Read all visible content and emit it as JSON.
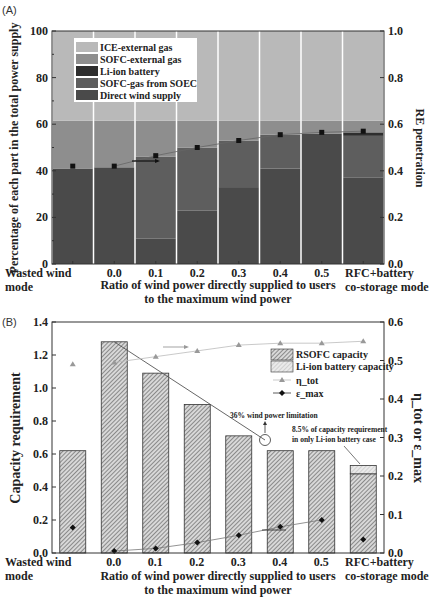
{
  "chart_data": [
    {
      "panel": "(A)",
      "type": "bar",
      "stacked": true,
      "categories": [
        "Wasted wind mode",
        "0.0",
        "0.1",
        "0.2",
        "0.3",
        "0.4",
        "0.5",
        "RFC+battery co-storage mode"
      ],
      "category_labels_line1": [
        "Wasted wind",
        "0.0",
        "0.1",
        "0.2",
        "0.3",
        "0.4",
        "0.5",
        "RFC+battery"
      ],
      "category_labels_line2": [
        "mode",
        "",
        "",
        "",
        "",
        "",
        "",
        "co-storage mode"
      ],
      "series": [
        {
          "name": "Direct wind supply",
          "color": "#4a4a4a",
          "values": [
            41,
            41.5,
            11,
            23,
            33,
            41,
            56,
            37
          ]
        },
        {
          "name": "SOFC-gas from SOEC",
          "color": "#5e5e5e",
          "values": [
            0,
            0,
            35,
            27,
            20,
            14.5,
            0,
            18
          ]
        },
        {
          "name": "Li-ion battery",
          "color": "#2e2e2e",
          "values": [
            0,
            0,
            0,
            0,
            0,
            0,
            0,
            1.5
          ]
        },
        {
          "name": "SOFC-external gas",
          "color": "#8e8e8e",
          "values": [
            20.5,
            20,
            15.5,
            11.5,
            8.5,
            6,
            5.5,
            5
          ]
        },
        {
          "name": "ICE-external gas",
          "color": "#b9b9b9",
          "values": [
            38.5,
            38.5,
            38.5,
            38.5,
            38.5,
            38.5,
            38.5,
            38.5
          ]
        }
      ],
      "line_series": {
        "name": "RE penetration",
        "axis": "right",
        "values": [
          0.42,
          0.42,
          0.465,
          0.5,
          0.53,
          0.555,
          0.565,
          0.57
        ]
      },
      "title": "",
      "xlabel": "Ratio of wind power directly supplied to users to the maximum wind power",
      "xlabel_line1": "Ratio of wind power directly supplied to users",
      "xlabel_line2": "to the maximum wind power",
      "ylabel": "Percentage of each part in the total power supply",
      "ylabel_right": "RE penetration",
      "ylim": [
        0,
        100
      ],
      "ylim_right": [
        0,
        1.0
      ],
      "yticks": [
        "0",
        "20",
        "40",
        "60",
        "80",
        "100"
      ],
      "yticks_right": [
        "0.0",
        "0.2",
        "0.4",
        "0.6",
        "0.8",
        "1.0"
      ],
      "legend": [
        "ICE-external gas",
        "SOFC-external gas",
        "Li-ion battery",
        "SOFC-gas from SOEC",
        "Direct wind supply"
      ],
      "legend_position": "upper left",
      "grid": false
    },
    {
      "panel": "(B)",
      "type": "bar",
      "stacked": true,
      "categories": [
        "Wasted wind mode",
        "0.0",
        "0.1",
        "0.2",
        "0.3",
        "0.4",
        "0.5",
        "RFC+battery co-storage mode"
      ],
      "category_labels_line1": [
        "Wasted wind",
        "0.0",
        "0.1",
        "0.2",
        "0.3",
        "0.4",
        "0.5",
        "RFC+battery"
      ],
      "category_labels_line2": [
        "mode",
        "",
        "",
        "",
        "",
        "",
        "",
        "co-storage mode"
      ],
      "series": [
        {
          "name": "RSOFC capacity",
          "pattern": "dense-hatch",
          "values": [
            0.62,
            1.28,
            1.09,
            0.9,
            0.71,
            0.62,
            0.62,
            0.48
          ]
        },
        {
          "name": "Li-ion battery capacity",
          "pattern": "light-hatch",
          "values": [
            0,
            0,
            0,
            0,
            0,
            0,
            0,
            0.05
          ]
        }
      ],
      "line_series": [
        {
          "name": "η_tot",
          "marker": "triangle",
          "axis": "right",
          "values": [
            0.49,
            0.495,
            0.51,
            0.525,
            0.54,
            0.545,
            0.545,
            0.55
          ]
        },
        {
          "name": "ε_max",
          "marker": "diamond",
          "axis": "right",
          "values": [
            0.066,
            0.005,
            0.012,
            0.027,
            0.046,
            0.068,
            0.086,
            0.035
          ]
        }
      ],
      "annotations": [
        "36% wind power limitation",
        "8.5% of capacity requirement in only Li-ion battery case"
      ],
      "annotation_line1": "36% wind power limitation",
      "annotation_line2a": "8.5% of capacity requirement",
      "annotation_line2b": "in only Li-ion battery case",
      "xlabel": "Ratio of wind power directly supplied to users to the maximum wind power",
      "xlabel_line1": "Ratio of wind power directly supplied to users",
      "xlabel_line2": "to the maximum wind power",
      "ylabel": "Capacity requirement",
      "ylabel_right": "η_tot or ε_max",
      "ylim": [
        0,
        1.4
      ],
      "ylim_right": [
        0,
        0.6
      ],
      "yticks": [
        "0.0",
        "0.2",
        "0.4",
        "0.6",
        "0.8",
        "1.0",
        "1.2",
        "1.4"
      ],
      "yticks_right": [
        "0.0",
        "0.1",
        "0.2",
        "0.3",
        "0.4",
        "0.5",
        "0.6"
      ],
      "legend": [
        "RSOFC capacity",
        "Li-ion battery capacity",
        "η_tot",
        "ε_max"
      ],
      "legend_position": "upper right",
      "grid": false
    }
  ]
}
